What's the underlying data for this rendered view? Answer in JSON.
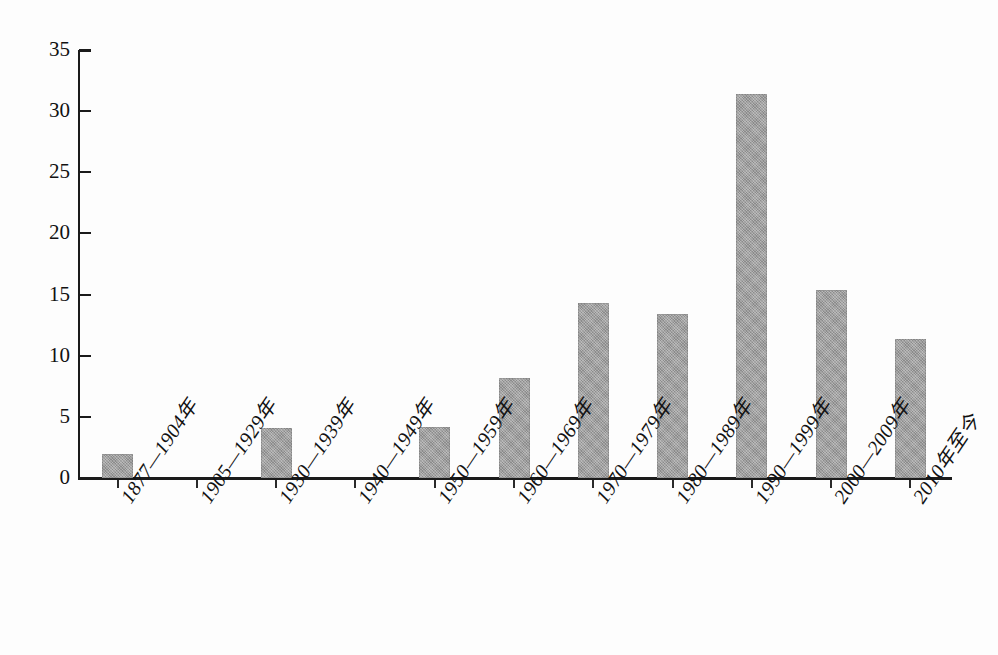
{
  "chart_data": {
    "type": "bar",
    "title": "",
    "subtitle": "",
    "xlabel": "",
    "ylabel": "",
    "ylim": [
      0,
      35
    ],
    "yticks": [
      0,
      5,
      10,
      15,
      20,
      25,
      30,
      35
    ],
    "grid": false,
    "legend": null,
    "bar_color": "#9b9b9b",
    "axis_color": "#1b1b1b",
    "categories": [
      "1877—1904年",
      "1905—1929年",
      "1930—1939年",
      "1940—1949年",
      "1950—1959年",
      "1960—1969年",
      "1970—1979年",
      "1980—1989年",
      "1990—1999年",
      "2000—2009年",
      "2010年至今"
    ],
    "values": [
      2.0,
      0,
      4.1,
      0,
      4.2,
      8.2,
      14.3,
      13.4,
      31.4,
      15.4,
      11.4
    ]
  }
}
